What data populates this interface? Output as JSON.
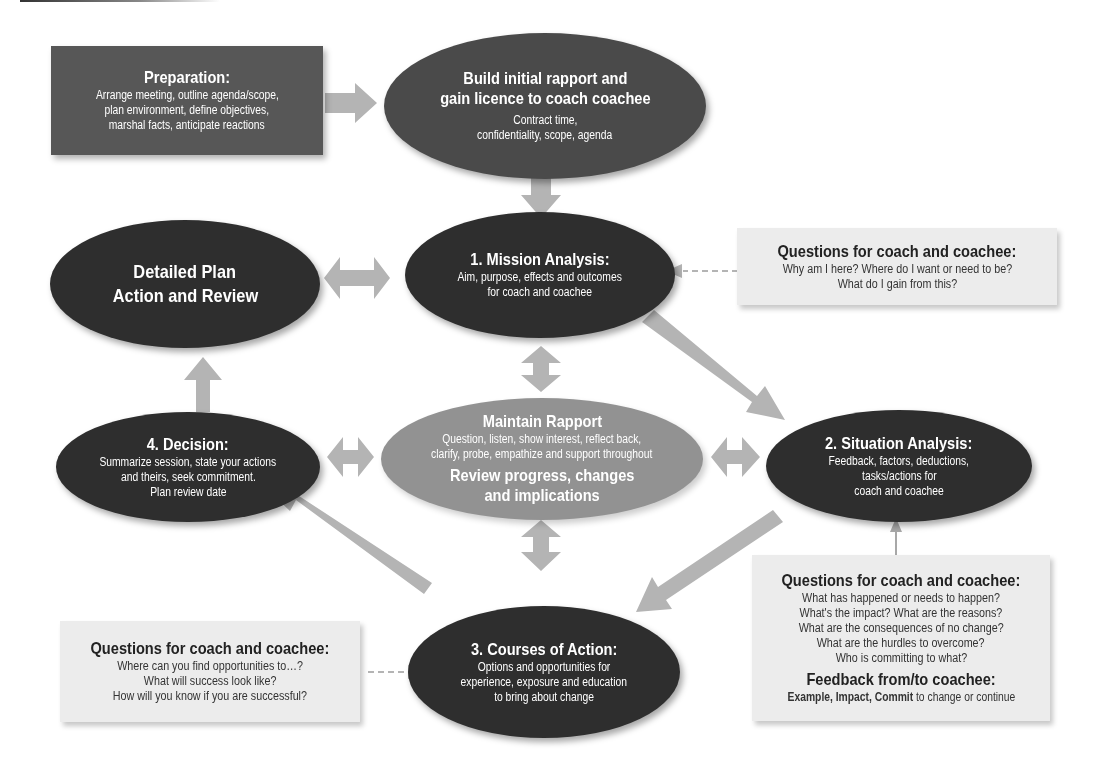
{
  "diagram": {
    "colors": {
      "dark_node": "#2e2e2e",
      "mid_node": "#3a3a3a",
      "center_node": "#929292",
      "prep_box": "#575757",
      "question_box": "#ececec",
      "arrow": "#b4b4b4"
    },
    "preparation": {
      "title": "Preparation:",
      "lines": [
        "Arrange meeting, outline agenda/scope,",
        "plan environment, define objectives,",
        "marshal facts, anticipate reactions"
      ]
    },
    "build_rapport": {
      "title_lines": [
        "Build initial rapport and",
        "gain licence to coach coachee"
      ],
      "lines": [
        "Contract time,",
        "confidentiality, scope, agenda"
      ]
    },
    "mission_analysis": {
      "title": "1. Mission Analysis:",
      "lines": [
        "Aim, purpose, effects and outcomes",
        "for coach and coachee"
      ]
    },
    "detailed_plan": {
      "title_lines": [
        "Detailed Plan",
        "Action and Review"
      ]
    },
    "maintain_rapport": {
      "title": "Maintain Rapport",
      "lines": [
        "Question, listen, show interest, reflect back,",
        "clarify, probe, empathize and support throughout"
      ],
      "subtitle_lines": [
        "Review progress, changes",
        "and implications"
      ]
    },
    "situation_analysis": {
      "title": "2. Situation Analysis:",
      "lines": [
        "Feedback, factors, deductions,",
        "tasks/actions for",
        "coach and coachee"
      ]
    },
    "decision": {
      "title": "4. Decision:",
      "lines": [
        "Summarize session, state your actions",
        "and theirs, seek commitment.",
        "Plan review date"
      ]
    },
    "courses_of_action": {
      "title": "3. Courses of Action:",
      "lines": [
        "Options and opportunities for",
        "experience, exposure and education",
        "to bring about change"
      ]
    },
    "questions_mission": {
      "title": "Questions for coach and coachee:",
      "lines": [
        "Why am I here? Where do I want or need to be?",
        "What do I gain from this?"
      ]
    },
    "questions_situation": {
      "title": "Questions for coach and coachee:",
      "lines": [
        "What has happened or needs to happen?",
        "What's the impact? What are the reasons?",
        "What are the consequences of no change?",
        "What are the hurdles to overcome?",
        "Who is committing to what?"
      ],
      "feedback_title": "Feedback from/to coachee:",
      "feedback_bold": "Example, Impact, Commit",
      "feedback_rest": " to change or continue"
    },
    "questions_courses": {
      "title": "Questions for coach and coachee:",
      "lines": [
        "Where can you find opportunities to…?",
        "What will success look like?",
        "How will you know if you are successful?"
      ]
    }
  }
}
